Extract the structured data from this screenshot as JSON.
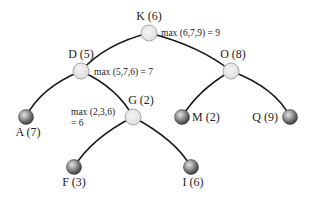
{
  "diagram": {
    "type": "tree",
    "colors": {
      "edge": "#1a1a1a",
      "internal_fill": "#e8e8e8",
      "internal_stroke": "#a8a8a8",
      "leaf_dark": "#555555",
      "leaf_light": "#dcdcdc",
      "text": "#222222"
    },
    "nodes": [
      {
        "id": "K",
        "label": "K (6)",
        "kind": "internal",
        "x": 149,
        "y": 33,
        "label_x": 149,
        "label_y": 20,
        "anchor": "middle"
      },
      {
        "id": "D",
        "label": "D (5)",
        "kind": "internal",
        "x": 81,
        "y": 71,
        "label_x": 81,
        "label_y": 58,
        "anchor": "middle"
      },
      {
        "id": "O",
        "label": "O (8)",
        "kind": "internal",
        "x": 231,
        "y": 71,
        "label_x": 233,
        "label_y": 58,
        "anchor": "middle"
      },
      {
        "id": "G",
        "label": "G (2)",
        "kind": "internal",
        "x": 133,
        "y": 117,
        "label_x": 141,
        "label_y": 104,
        "anchor": "middle"
      },
      {
        "id": "A",
        "label": "A (7)",
        "kind": "leaf",
        "x": 26,
        "y": 117,
        "label_x": 28,
        "label_y": 136,
        "anchor": "middle"
      },
      {
        "id": "M",
        "label": "M (2)",
        "kind": "leaf",
        "x": 182,
        "y": 117,
        "label_x": 192,
        "label_y": 121,
        "anchor": "start"
      },
      {
        "id": "Q",
        "label": "Q (9)",
        "kind": "leaf",
        "x": 290,
        "y": 117,
        "label_x": 278,
        "label_y": 121,
        "anchor": "end"
      },
      {
        "id": "F",
        "label": "F (3)",
        "kind": "leaf",
        "x": 74,
        "y": 167,
        "label_x": 74,
        "label_y": 186,
        "anchor": "middle"
      },
      {
        "id": "I",
        "label": "I (6)",
        "kind": "leaf",
        "x": 191,
        "y": 167,
        "label_x": 193,
        "label_y": 186,
        "anchor": "middle"
      }
    ],
    "edges": [
      {
        "from": "K",
        "to": "D",
        "path": "M149,33 Q105,44 81,71"
      },
      {
        "from": "K",
        "to": "O",
        "path": "M149,33 Q200,46 231,71"
      },
      {
        "from": "D",
        "to": "A",
        "path": "M81,71 Q40,88 26,117"
      },
      {
        "from": "D",
        "to": "G",
        "path": "M81,71 Q118,88 133,117"
      },
      {
        "from": "O",
        "to": "M",
        "path": "M231,71 Q198,90 182,117"
      },
      {
        "from": "O",
        "to": "Q",
        "path": "M231,71 Q276,88 290,117"
      },
      {
        "from": "G",
        "to": "F",
        "path": "M133,117 Q92,138 74,167"
      },
      {
        "from": "G",
        "to": "I",
        "path": "M133,117 Q176,140 191,167"
      }
    ],
    "annotations": [
      {
        "id": "ann-k",
        "lines": [
          "max (6,7,9) = 9"
        ],
        "x": 161,
        "y": 36
      },
      {
        "id": "ann-d",
        "lines": [
          "max (5,7,6) = 7"
        ],
        "x": 94,
        "y": 75
      },
      {
        "id": "ann-g",
        "lines": [
          "max (2,3,6)",
          "= 6"
        ],
        "x": 71,
        "y": 115
      }
    ]
  }
}
